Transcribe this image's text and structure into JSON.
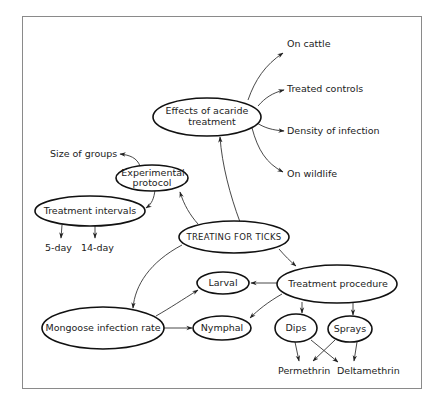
{
  "diagram": {
    "type": "concept-map",
    "central_node": "TREATING FOR TICKS",
    "nodes": {
      "central": {
        "label": "TREATING FOR TICKS"
      },
      "effects": {
        "line1": "Effects of acaride",
        "line2": "treatment"
      },
      "protocol": {
        "line1": "Experimental",
        "line2": "protocol"
      },
      "intervals": {
        "label": "Treatment intervals"
      },
      "procedure": {
        "label": "Treatment procedure"
      },
      "mongoose": {
        "label": "Mongoose infection rate"
      },
      "larval": {
        "label": "Larval"
      },
      "nymphal": {
        "label": "Nymphal"
      },
      "dips": {
        "label": "Dips"
      },
      "sprays": {
        "label": "Sprays"
      }
    },
    "leaves": {
      "on_cattle": "On cattle",
      "treated_controls": "Treated controls",
      "density_of_infection": "Density of infection",
      "on_wildlife": "On wildlife",
      "size_of_groups": "Size of groups",
      "five_day": "5-day",
      "fourteen_day": "14-day",
      "permethrin": "Permethrin",
      "deltamethrin": "Deltamethrin"
    },
    "edges": [
      {
        "from": "TREATING FOR TICKS",
        "to": "Effects of acaride treatment"
      },
      {
        "from": "TREATING FOR TICKS",
        "to": "Experimental protocol"
      },
      {
        "from": "TREATING FOR TICKS",
        "to": "Treatment procedure"
      },
      {
        "from": "TREATING FOR TICKS",
        "to": "Mongoose infection rate"
      },
      {
        "from": "Effects of acaride treatment",
        "to": "On cattle"
      },
      {
        "from": "Effects of acaride treatment",
        "to": "Treated controls"
      },
      {
        "from": "Effects of acaride treatment",
        "to": "Density of infection"
      },
      {
        "from": "Effects of acaride treatment",
        "to": "On wildlife"
      },
      {
        "from": "Experimental protocol",
        "to": "Size of groups"
      },
      {
        "from": "Experimental protocol",
        "to": "Treatment intervals"
      },
      {
        "from": "Treatment intervals",
        "to": "5-day"
      },
      {
        "from": "Treatment intervals",
        "to": "14-day"
      },
      {
        "from": "Treatment procedure",
        "to": "Larval"
      },
      {
        "from": "Treatment procedure",
        "to": "Nymphal"
      },
      {
        "from": "Treatment procedure",
        "to": "Dips"
      },
      {
        "from": "Treatment procedure",
        "to": "Sprays"
      },
      {
        "from": "Mongoose infection rate",
        "to": "Larval"
      },
      {
        "from": "Mongoose infection rate",
        "to": "Nymphal"
      },
      {
        "from": "Dips",
        "to": "Permethrin"
      },
      {
        "from": "Dips",
        "to": "Deltamethrin"
      },
      {
        "from": "Sprays",
        "to": "Permethrin"
      },
      {
        "from": "Sprays",
        "to": "Deltamethrin"
      }
    ],
    "colors": {
      "stroke": "#111111",
      "frame": "#8a8a8a",
      "background": "#ffffff"
    }
  }
}
